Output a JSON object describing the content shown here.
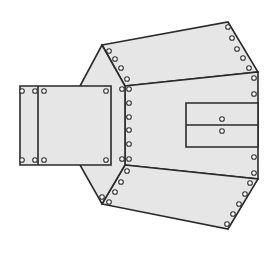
{
  "diagram": {
    "type": "pattern-layout",
    "colors": {
      "panel_fill": "#e6e6e6",
      "outline": "#2a2a2a",
      "grommet_stroke": "#333333",
      "background": "#ffffff"
    },
    "panels": [
      {
        "name": "top-wing-panel",
        "points": "102,45 228,22 258,72 125,86"
      },
      {
        "name": "center-panel",
        "points": "125,86 258,72 258,179 125,165"
      },
      {
        "name": "bottom-wing-panel",
        "points": "125,165 258,179 228,229 102,204"
      },
      {
        "name": "left-hex-panel",
        "points": "102,45 125,86 125,165 102,204 80,165 80,86"
      },
      {
        "name": "inner-flap-panel",
        "points": "186,103 258,103 258,147 186,147"
      },
      {
        "name": "square-flap-panel",
        "points": "20,86 111,86 111,165 20,165"
      }
    ],
    "lines": [
      {
        "name": "flap-divider-line",
        "x1": 186,
        "y1": 125,
        "x2": 258,
        "y2": 125
      },
      {
        "name": "square-fold-line",
        "x1": 38,
        "y1": 86,
        "x2": 38,
        "y2": 165
      }
    ],
    "grommets": [
      [
        109,
        51
      ],
      [
        115,
        59
      ],
      [
        121,
        68
      ],
      [
        127,
        79
      ],
      [
        228,
        27
      ],
      [
        232,
        38
      ],
      [
        237,
        49
      ],
      [
        243,
        58
      ],
      [
        249,
        68
      ],
      [
        254,
        78
      ],
      [
        254,
        94
      ],
      [
        129,
        89
      ],
      [
        129,
        103
      ],
      [
        129,
        117
      ],
      [
        129,
        130
      ],
      [
        129,
        144
      ],
      [
        129,
        159
      ],
      [
        122,
        89
      ],
      [
        122,
        159
      ],
      [
        222,
        119
      ],
      [
        222,
        131
      ],
      [
        254,
        157
      ],
      [
        254,
        173
      ],
      [
        250,
        183
      ],
      [
        245,
        194
      ],
      [
        239,
        204
      ],
      [
        233,
        214
      ],
      [
        227,
        224
      ],
      [
        127,
        171
      ],
      [
        121,
        182
      ],
      [
        115,
        192
      ],
      [
        109,
        202
      ],
      [
        102,
        197
      ],
      [
        22,
        91
      ],
      [
        35,
        91
      ],
      [
        44,
        91
      ],
      [
        106,
        91
      ],
      [
        22,
        160
      ],
      [
        35,
        160
      ],
      [
        44,
        160
      ],
      [
        106,
        160
      ]
    ]
  }
}
